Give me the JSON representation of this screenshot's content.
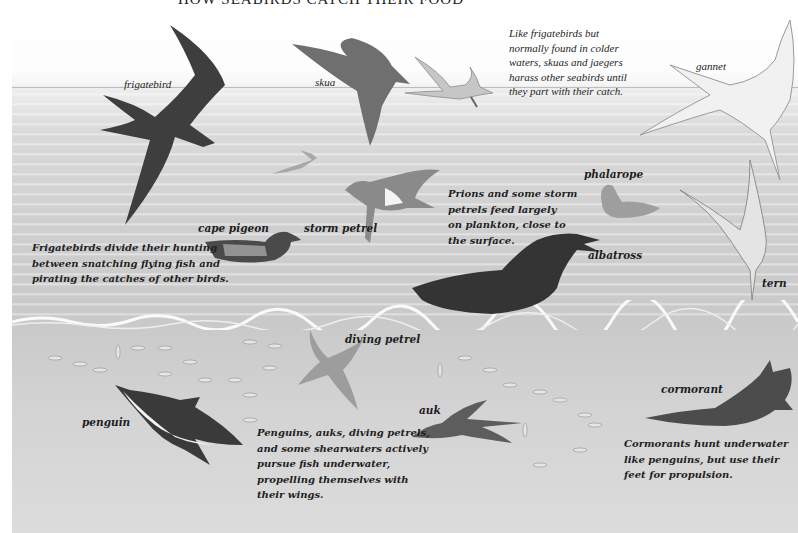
{
  "title": "HOW SEABIRDS CATCH THEIR FOOD",
  "colors": {
    "sky": "#ffffff",
    "sea_surface": "#d2d2d2",
    "underwater": "#d6d6d6",
    "text": "#1d1d1d",
    "dark_bird": "#3a3a3a",
    "mid_bird": "#7a7a7a"
  },
  "labels": {
    "frigatebird": "frigatebird",
    "skua": "skua",
    "gannet": "gannet",
    "cape_pigeon": "cape pigeon",
    "storm_petrel": "storm petrel",
    "phalarope": "phalarope",
    "albatross": "albatross",
    "tern": "tern",
    "diving_petrel": "diving petrel",
    "penguin": "penguin",
    "auk": "auk",
    "cormorant": "cormorant"
  },
  "notes": {
    "skua": [
      "Like frigatebirds but",
      "normally found in colder",
      "waters, skuas and jaegers",
      "harass other seabirds until",
      "they part with their catch."
    ],
    "frigatebird": [
      "Frigatebirds divide their hunting",
      "between snatching flying fish and",
      "pirating the catches of other birds."
    ],
    "prions": [
      "Prions and some storm",
      "petrels feed largely",
      "on plankton, close to",
      "the surface."
    ],
    "penguins": [
      "Penguins, auks, diving petrels,",
      "and some shearwaters actively",
      "pursue fish underwater,",
      "propelling themselves with",
      "their wings."
    ],
    "cormorants": [
      "Cormorants hunt underwater",
      "like penguins, but use their",
      "feet for propulsion."
    ]
  }
}
